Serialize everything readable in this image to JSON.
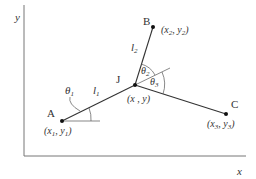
{
  "diagram": {
    "type": "kinematic-linkage",
    "axes": {
      "x_label": "x",
      "y_label": "y"
    },
    "points": {
      "A": {
        "name": "A",
        "coords": "(x",
        "sub1": "1",
        "comma": ", y",
        "sub2": "1",
        "close": ")"
      },
      "B": {
        "name": "B",
        "coords": "(x",
        "sub1": "2",
        "comma": ", y",
        "sub2": "2",
        "close": ")"
      },
      "C": {
        "name": "C",
        "coords": "(x",
        "sub1": "3",
        "comma": ", y",
        "sub2": "3",
        "close": ")"
      },
      "J": {
        "name": "J",
        "coords": "(x , y)"
      }
    },
    "links": {
      "l1": {
        "base": "l",
        "sub": "1"
      },
      "l2": {
        "base": "l",
        "sub": "2"
      }
    },
    "angles": {
      "theta1": {
        "base": "θ",
        "sub": "1"
      },
      "theta2": {
        "base": "θ",
        "sub": "2"
      },
      "theta3": {
        "base": "θ",
        "sub": "3"
      }
    },
    "colors": {
      "line": "#333333",
      "axis": "#666666",
      "text": "#333333"
    }
  }
}
